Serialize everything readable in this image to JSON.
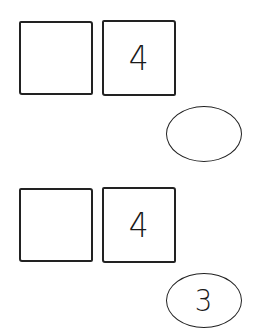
{
  "rows": [
    {
      "left_box": {
        "value": ""
      },
      "right_box": {
        "value": "4"
      },
      "oval": {
        "value": ""
      }
    },
    {
      "left_box": {
        "value": ""
      },
      "right_box": {
        "value": "4"
      },
      "oval": {
        "value": "3"
      }
    }
  ],
  "colors": {
    "stroke": "#222222",
    "background": "#ffffff"
  }
}
